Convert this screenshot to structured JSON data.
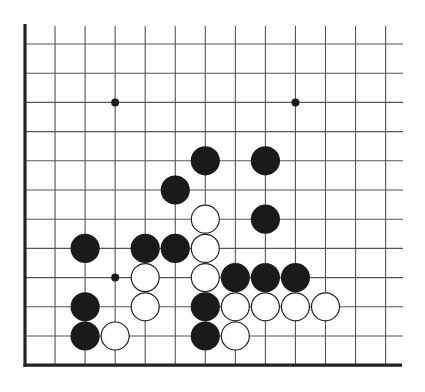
{
  "diagram": {
    "type": "go-board-fragment",
    "edges": [
      "left",
      "bottom"
    ],
    "colors": {
      "background": "#ffffff",
      "grid": "#555555",
      "edge": "#222222",
      "black_stone": "#1a1a1a",
      "white_stone": "#ffffff",
      "white_stone_outline": "#222222",
      "star_point": "#1a1a1a"
    },
    "grid": {
      "columns": 13,
      "rows": 12,
      "origin_x": 25,
      "origin_y": 44,
      "spacing_x": 30.05,
      "spacing_y": 29.2,
      "line_top": 26,
      "line_right": 403,
      "stone_radius": 14.6
    },
    "star_points": [
      {
        "col": 3,
        "row": 2
      },
      {
        "col": 9,
        "row": 2
      },
      {
        "col": 3,
        "row": 8
      }
    ],
    "stones": [
      {
        "color": "black",
        "col": 6,
        "row": 4
      },
      {
        "color": "black",
        "col": 8,
        "row": 4
      },
      {
        "color": "black",
        "col": 5,
        "row": 5
      },
      {
        "color": "white",
        "col": 6,
        "row": 6
      },
      {
        "color": "black",
        "col": 8,
        "row": 6
      },
      {
        "color": "black",
        "col": 2,
        "row": 7
      },
      {
        "color": "black",
        "col": 4,
        "row": 7
      },
      {
        "color": "black",
        "col": 5,
        "row": 7
      },
      {
        "color": "white",
        "col": 6,
        "row": 7
      },
      {
        "color": "white",
        "col": 4,
        "row": 8
      },
      {
        "color": "white",
        "col": 6,
        "row": 8
      },
      {
        "color": "black",
        "col": 7,
        "row": 8
      },
      {
        "color": "black",
        "col": 8,
        "row": 8
      },
      {
        "color": "black",
        "col": 9,
        "row": 8
      },
      {
        "color": "black",
        "col": 2,
        "row": 9
      },
      {
        "color": "white",
        "col": 4,
        "row": 9
      },
      {
        "color": "black",
        "col": 6,
        "row": 9
      },
      {
        "color": "white",
        "col": 7,
        "row": 9
      },
      {
        "color": "white",
        "col": 8,
        "row": 9
      },
      {
        "color": "white",
        "col": 9,
        "row": 9
      },
      {
        "color": "white",
        "col": 10,
        "row": 9
      },
      {
        "color": "black",
        "col": 2,
        "row": 10
      },
      {
        "color": "white",
        "col": 3,
        "row": 10
      },
      {
        "color": "black",
        "col": 6,
        "row": 10
      },
      {
        "color": "white",
        "col": 7,
        "row": 10
      }
    ]
  }
}
